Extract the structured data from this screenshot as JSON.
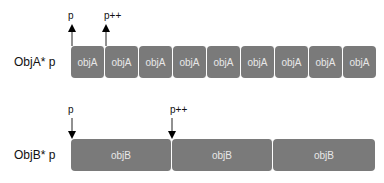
{
  "rowA": {
    "label": "ObjA*  p",
    "box_label": "objA",
    "boxes": [
      "objA",
      "objA",
      "objA",
      "objA",
      "objA",
      "objA",
      "objA",
      "objA",
      "objA"
    ],
    "pointer_start": "p",
    "pointer_next": "p++"
  },
  "rowB": {
    "label": "ObjB*  p",
    "boxes": [
      "objB",
      "objB",
      "objB"
    ],
    "pointer_start": "p",
    "pointer_next": "p++"
  },
  "colors": {
    "box": "#7a7a7a",
    "box_text": "#e8e8e8",
    "arrow": "#000000"
  }
}
